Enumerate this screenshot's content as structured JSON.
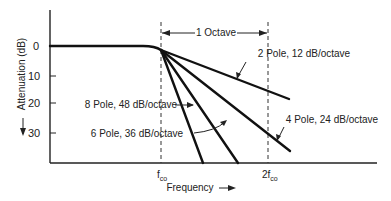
{
  "diagram": {
    "y_axis": {
      "label": "Attenuation (dB)",
      "direction": "increasing downward",
      "ticks": [
        "0",
        "10",
        "20",
        "30"
      ]
    },
    "x_axis": {
      "label": "Frequency",
      "markers": [
        {
          "main": "f",
          "sub": "co"
        },
        {
          "main": "2f",
          "sub": "co"
        }
      ]
    },
    "span_annotation": "1 Octave",
    "curves": [
      {
        "id": "2-pole",
        "label": "2 Pole, 12 dB/octave",
        "slope_db_per_octave": 12
      },
      {
        "id": "4-pole",
        "label": "4 Pole, 24 dB/octave",
        "slope_db_per_octave": 24
      },
      {
        "id": "6-pole",
        "label": "6 Pole, 36 dB/octave",
        "slope_db_per_octave": 36
      },
      {
        "id": "8-pole",
        "label": "8 Pole, 48 dB/octave",
        "slope_db_per_octave": 48
      }
    ]
  }
}
